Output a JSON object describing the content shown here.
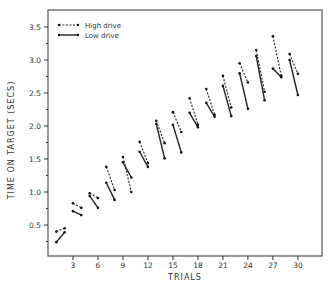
{
  "chart_data": {
    "type": "line",
    "title": "",
    "xlabel": "TRIALS",
    "ylabel": "TIME ON TARGET  (SECS)",
    "xlim": [
      0,
      32
    ],
    "ylim": [
      0,
      3.7
    ],
    "x_ticks": [
      3,
      6,
      9,
      12,
      15,
      18,
      21,
      24,
      27,
      30
    ],
    "x_tick_labels": [
      "3",
      "6",
      "9",
      "12",
      "15",
      "18",
      "21",
      "24",
      "27",
      "30"
    ],
    "y_ticks": [
      0.5,
      1.0,
      1.5,
      2.0,
      2.5,
      3.0,
      3.5
    ],
    "y_tick_labels": [
      "0.5",
      "1.0",
      "1.5",
      "2.0",
      "2.5",
      "3.0",
      "3.5"
    ],
    "grid": false,
    "legend_position": "upper-left",
    "note": "Data plotted as disconnected pairs of consecutive trials",
    "series": [
      {
        "name": "High drive",
        "style": "dashed",
        "segments": [
          [
            [
              1,
              0.4
            ],
            [
              2,
              0.45
            ]
          ],
          [
            [
              3,
              0.83
            ],
            [
              4,
              0.76
            ]
          ],
          [
            [
              5,
              0.98
            ],
            [
              6,
              0.91
            ]
          ],
          [
            [
              7,
              1.38
            ],
            [
              8,
              1.03
            ]
          ],
          [
            [
              9,
              1.53
            ],
            [
              10,
              1.0
            ]
          ],
          [
            [
              11,
              1.76
            ],
            [
              12,
              1.44
            ]
          ],
          [
            [
              13,
              2.08
            ],
            [
              14,
              1.74
            ]
          ],
          [
            [
              15,
              2.21
            ],
            [
              16,
              1.91
            ]
          ],
          [
            [
              17,
              2.42
            ],
            [
              18,
              2.02
            ]
          ],
          [
            [
              19,
              2.56
            ],
            [
              20,
              2.17
            ]
          ],
          [
            [
              21,
              2.76
            ],
            [
              22,
              2.28
            ]
          ],
          [
            [
              23,
              2.95
            ],
            [
              24,
              2.66
            ]
          ],
          [
            [
              25,
              3.15
            ],
            [
              26,
              2.52
            ]
          ],
          [
            [
              27,
              3.36
            ],
            [
              28,
              2.76
            ]
          ],
          [
            [
              29,
              3.09
            ],
            [
              30,
              2.79
            ]
          ]
        ]
      },
      {
        "name": "Low drive",
        "style": "solid",
        "segments": [
          [
            [
              1,
              0.24
            ],
            [
              2,
              0.39
            ]
          ],
          [
            [
              3,
              0.71
            ],
            [
              4,
              0.65
            ]
          ],
          [
            [
              5,
              0.94
            ],
            [
              6,
              0.76
            ]
          ],
          [
            [
              7,
              1.14
            ],
            [
              8,
              0.88
            ]
          ],
          [
            [
              9,
              1.45
            ],
            [
              10,
              1.22
            ]
          ],
          [
            [
              11,
              1.61
            ],
            [
              12,
              1.38
            ]
          ],
          [
            [
              13,
              2.03
            ],
            [
              14,
              1.51
            ]
          ],
          [
            [
              15,
              2.02
            ],
            [
              16,
              1.6
            ]
          ],
          [
            [
              17,
              2.2
            ],
            [
              18,
              1.98
            ]
          ],
          [
            [
              19,
              2.35
            ],
            [
              20,
              2.14
            ]
          ],
          [
            [
              21,
              2.61
            ],
            [
              22,
              2.15
            ]
          ],
          [
            [
              23,
              2.8
            ],
            [
              24,
              2.26
            ]
          ],
          [
            [
              25,
              3.06
            ],
            [
              26,
              2.39
            ]
          ],
          [
            [
              27,
              2.87
            ],
            [
              28,
              2.74
            ]
          ],
          [
            [
              29,
              3.0
            ],
            [
              30,
              2.47
            ]
          ]
        ]
      }
    ]
  },
  "legend": {
    "high_label": "High drive",
    "low_label": "Low drive"
  },
  "axes": {
    "xlabel": "TRIALS",
    "ylabel": "TIME ON TARGET  (SECS)"
  }
}
